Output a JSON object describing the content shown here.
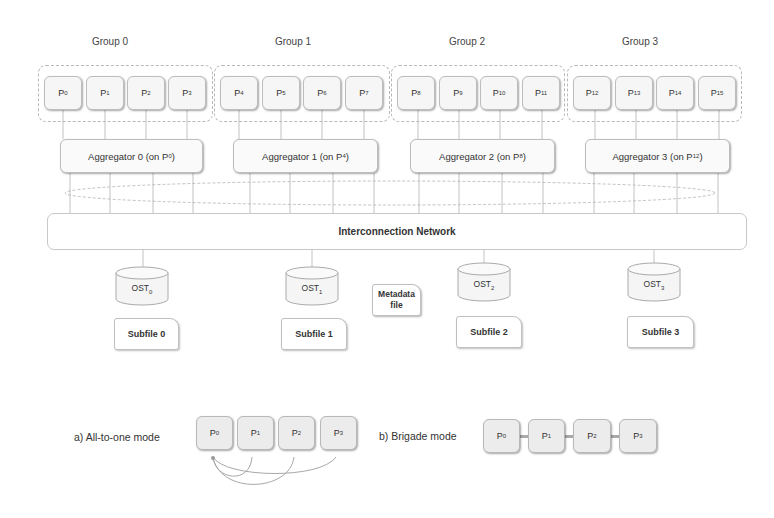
{
  "groups": [
    {
      "label": "Group 0",
      "processes": [
        {
          "p": "P",
          "s": "0"
        },
        {
          "p": "P",
          "s": "1"
        },
        {
          "p": "P",
          "s": "2"
        },
        {
          "p": "P",
          "s": "3"
        }
      ],
      "aggregator": {
        "text": "Aggregator 0 (on P",
        "sub": "0",
        "close": ")"
      }
    },
    {
      "label": "Group 1",
      "processes": [
        {
          "p": "P",
          "s": "4"
        },
        {
          "p": "P",
          "s": "5"
        },
        {
          "p": "P",
          "s": "6"
        },
        {
          "p": "P",
          "s": "7"
        }
      ],
      "aggregator": {
        "text": "Aggregator 1 (on P",
        "sub": "4",
        "close": ")"
      }
    },
    {
      "label": "Group 2",
      "processes": [
        {
          "p": "P",
          "s": "8"
        },
        {
          "p": "P",
          "s": "9"
        },
        {
          "p": "P",
          "s": "10"
        },
        {
          "p": "P",
          "s": "11"
        }
      ],
      "aggregator": {
        "text": "Aggregator 2 (on P",
        "sub": "8",
        "close": ")"
      }
    },
    {
      "label": "Group 3",
      "processes": [
        {
          "p": "P",
          "s": "12"
        },
        {
          "p": "P",
          "s": "13"
        },
        {
          "p": "P",
          "s": "14"
        },
        {
          "p": "P",
          "s": "15"
        }
      ],
      "aggregator": {
        "text": "Aggregator 3 (on P",
        "sub": "12",
        "close": ")"
      }
    }
  ],
  "network": {
    "label": "Interconnection Network"
  },
  "osts": [
    {
      "p": "OST",
      "s": "0",
      "subfile": "Subfile 0"
    },
    {
      "p": "OST",
      "s": "1",
      "subfile": "Subfile 1"
    },
    {
      "p": "OST",
      "s": "2",
      "subfile": "Subfile 2"
    },
    {
      "p": "OST",
      "s": "3",
      "subfile": "Subfile 3"
    }
  ],
  "metadata": {
    "line1": "Metadata",
    "line2": "file"
  },
  "modes": {
    "a": {
      "label": "a) All-to-one mode",
      "processes": [
        {
          "p": "P",
          "s": "0"
        },
        {
          "p": "P",
          "s": "1"
        },
        {
          "p": "P",
          "s": "2"
        },
        {
          "p": "P",
          "s": "3"
        }
      ]
    },
    "b": {
      "label": "b) Brigade mode",
      "processes": [
        {
          "p": "P",
          "s": "0"
        },
        {
          "p": "P",
          "s": "1"
        },
        {
          "p": "P",
          "s": "2"
        },
        {
          "p": "P",
          "s": "3"
        }
      ]
    }
  },
  "colors": {
    "line": "#b0b0b0",
    "box_border": "#bdbdbd",
    "box_fill": "#f6f6f6",
    "text": "#333333"
  }
}
